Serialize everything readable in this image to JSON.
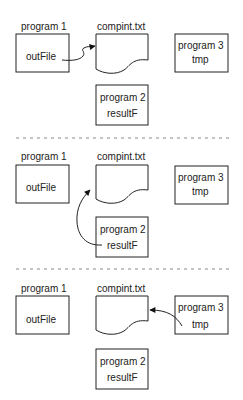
{
  "panels": [
    {
      "program1": {
        "title": "program 1",
        "var": "outFile"
      },
      "file": {
        "title": "compint.txt"
      },
      "program2": {
        "title": "program 2",
        "var": "resultF"
      },
      "program3": {
        "title": "program 3",
        "var": "tmp"
      },
      "arrow": "program1 -> file"
    },
    {
      "program1": {
        "title": "program 1",
        "var": "outFile"
      },
      "file": {
        "title": "compint.txt"
      },
      "program2": {
        "title": "program 2",
        "var": "resultF"
      },
      "program3": {
        "title": "program 3",
        "var": "tmp"
      },
      "arrow": "program2 -> file"
    },
    {
      "program1": {
        "title": "program 1",
        "var": "outFile"
      },
      "file": {
        "title": "compint.txt"
      },
      "program2": {
        "title": "program 2",
        "var": "resultF"
      },
      "program3": {
        "title": "program 3",
        "var": "tmp"
      },
      "arrow": "program3 -> file"
    }
  ],
  "colors": {
    "stroke": "#222222",
    "divider": "#888888"
  }
}
